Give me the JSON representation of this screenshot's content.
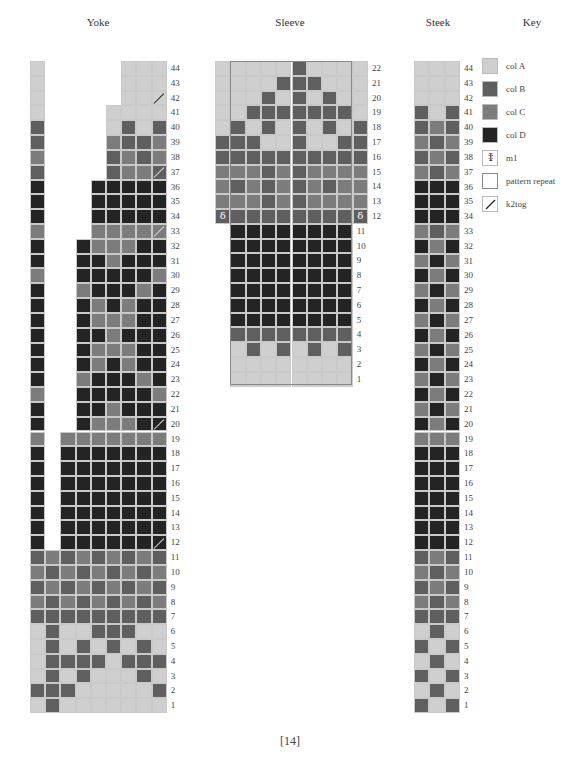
{
  "titles": {
    "yoke": "Yoke",
    "sleeve": "Sleeve",
    "steek": "Steek",
    "key": "Key"
  },
  "colors": {
    "A": "#cfcfcf",
    "B": "#5f5f5f",
    "C": "#7c7c7c",
    "D": "#242424"
  },
  "key": {
    "items": [
      {
        "symbol": "A",
        "label": "col A"
      },
      {
        "symbol": "B",
        "label": "col B"
      },
      {
        "symbol": "C",
        "label": "col C"
      },
      {
        "symbol": "D",
        "label": "col D"
      },
      {
        "symbol": "m1-icon",
        "label": "m1"
      },
      {
        "symbol": "pattern-repeat-icon",
        "label": "pattern repeat"
      },
      {
        "symbol": "k2tog-icon",
        "label": "k2tog"
      }
    ]
  },
  "yoke": {
    "row_labels": [
      "44",
      "43",
      "42",
      "41",
      "40",
      "39",
      "38",
      "37",
      "36",
      "35",
      "34",
      "33",
      "32",
      "31",
      "30",
      "29",
      "28",
      "27",
      "26",
      "25",
      "24",
      "23",
      "22",
      "21",
      "20",
      "19",
      "18",
      "17",
      "16",
      "15",
      "14",
      "13",
      "12",
      "11",
      "10",
      "9",
      "8",
      "7",
      "6",
      "5",
      "4",
      "3",
      "2",
      "1"
    ],
    "rows": [
      "A-----AAA",
      "A-----AAA",
      "A-----AAA",
      "A----AAAA",
      "B----ABAB",
      "B----CBBC",
      "C----BCBC",
      "B----BCCB",
      "D---DDDDD",
      "D---DDDDD",
      "D---DDDDD",
      "C---CCCCC",
      "D--DCCCDD",
      "D--DDCDDD",
      "C--DDDDDC",
      "D--CDDDCD",
      "D--DCDCDD",
      "D--DCCCDD",
      "D--DDCDDD",
      "D--DCCCDD",
      "D--DCDCDD",
      "D--CDDDCD",
      "C--DDDDDC",
      "D--DDCDDD",
      "D--DCCCDD",
      "C-CCCCCCC",
      "D-DDDDDDD",
      "D-DDDDDDD",
      "D-DDDDDDD",
      "D-DDDDDDD",
      "D-DDDDDDD",
      "D-DDDDDDD",
      "D-DDDDDDD",
      "BCBCBCBCB",
      "CBCBCBCBC",
      "BCBCBCBCB",
      "CBCBCBCBC",
      "BBBBBBBBB",
      "ABAABBBAA",
      "ABABABABA",
      "ABBBBABBB",
      "ABABAAABA",
      "BBBAAAAAB",
      "ABAAAAAAA"
    ],
    "k2tog_rows": [
      "42",
      "37",
      "33",
      "20",
      "12"
    ]
  },
  "sleeve": {
    "row_labels": [
      "22",
      "21",
      "20",
      "19",
      "18",
      "17",
      "16",
      "15",
      "14",
      "13",
      "12",
      "11",
      "10",
      "9",
      "8",
      "7",
      "6",
      "5",
      "4",
      "3",
      "2",
      "1"
    ],
    "rows": [
      "AAAAABAAAA",
      "AAAABBBAAA",
      "AAABABABAA",
      "AABBBBBBBA",
      "ABABABABAB",
      "BBBAABAABB",
      "BBBBBBBBBB",
      "CCCBCBCCCC",
      "CBCBCBCBCC",
      "CCCBCBCCCC",
      "BBBBBBBBBB",
      "-DDDDDDDD",
      "-DDDDDDDD",
      "-DDDDDDDD",
      "-DDDDDDDD",
      "-DDDDDDDD",
      "-DDDDDDDD",
      "-DDDDDDDD",
      "-BBBBBBBB",
      "-ABABABAB",
      "-AAAAAAAA",
      "-AAAAAAAA"
    ],
    "m1_row": "12"
  },
  "steek": {
    "row_labels": [
      "44",
      "43",
      "42",
      "41",
      "40",
      "39",
      "38",
      "37",
      "36",
      "35",
      "34",
      "33",
      "32",
      "31",
      "30",
      "29",
      "28",
      "27",
      "26",
      "25",
      "24",
      "23",
      "22",
      "21",
      "20",
      "19",
      "18",
      "17",
      "16",
      "15",
      "14",
      "13",
      "12",
      "11",
      "10",
      "9",
      "8",
      "7",
      "6",
      "5",
      "4",
      "3",
      "2",
      "1"
    ],
    "rows": [
      "AAA",
      "AAA",
      "AAA",
      "BAB",
      "BCB",
      "CBC",
      "BCB",
      "CBC",
      "DDD",
      "DDD",
      "DDD",
      "CBC",
      "DCD",
      "CDC",
      "DCD",
      "CDC",
      "DCD",
      "CDC",
      "DCD",
      "CDC",
      "DCD",
      "CDC",
      "DCD",
      "CDC",
      "DCD",
      "CCC",
      "DDD",
      "DDD",
      "DDD",
      "DDD",
      "DDD",
      "DDD",
      "DDD",
      "BCB",
      "CBC",
      "BCB",
      "CBC",
      "BBB",
      "ABA",
      "BAB",
      "ABA",
      "BAB",
      "ABA",
      "BAB"
    ]
  },
  "page_number": "[14]"
}
